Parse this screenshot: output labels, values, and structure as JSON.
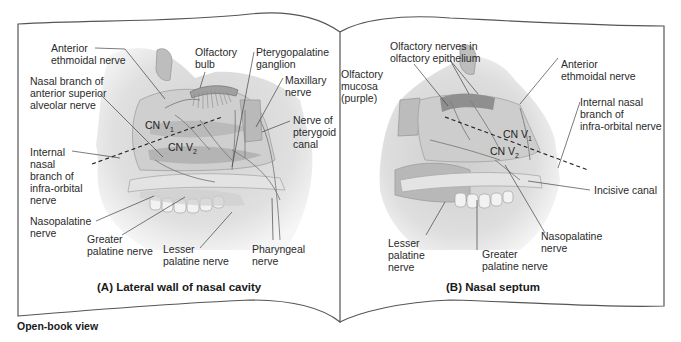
{
  "figure": {
    "footer_label": "Open-book view",
    "panels": [
      {
        "id": "A",
        "caption": "(A) Lateral wall of nasal cavity",
        "labels": {
          "anterior_ethmoidal": [
            "Anterior",
            "ethmoidal nerve"
          ],
          "nasal_branch_asa": [
            "Nasal branch of",
            "anterior superior",
            "alveolar nerve"
          ],
          "olfactory_bulb": [
            "Olfactory",
            "bulb"
          ],
          "pterygopalatine": [
            "Pterygopalatine",
            "ganglion"
          ],
          "maxillary": [
            "Maxillary",
            "nerve"
          ],
          "pterygoid_canal": [
            "Nerve of",
            "pterygoid",
            "canal"
          ],
          "internal_nasal": [
            "Internal",
            "nasal",
            "branch of",
            "infra-orbital",
            "nerve"
          ],
          "nasopalatine": [
            "Nasopalatine",
            "nerve"
          ],
          "greater_palatine": [
            "Greater",
            "palatine nerve"
          ],
          "lesser_palatine": [
            "Lesser",
            "palatine nerve"
          ],
          "pharyngeal": [
            "Pharyngeal",
            "nerve"
          ],
          "cn_v1": {
            "base": "CN V",
            "sub": "1"
          },
          "cn_v2": {
            "base": "CN V",
            "sub": "2"
          }
        }
      },
      {
        "id": "B",
        "caption": "(B) Nasal septum",
        "labels": {
          "olfactory_nerves": [
            "Olfactory nerves in",
            "olfactory epithelium"
          ],
          "olfactory_mucosa": [
            "Olfactory",
            "mucosa",
            "(purple)"
          ],
          "anterior_ethmoidal": [
            "Anterior",
            "ethmoidal nerve"
          ],
          "internal_nasal": [
            "Internal nasal",
            "branch of",
            "infra-orbital nerve"
          ],
          "incisive_canal": [
            "Incisive canal"
          ],
          "nasopalatine": [
            "Nasopalatine",
            "nerve"
          ],
          "lesser_palatine": [
            "Lesser",
            "palatine",
            "nerve"
          ],
          "greater_palatine": [
            "Greater",
            "palatine nerve"
          ],
          "cn_v1": {
            "base": "CN V",
            "sub": "1"
          },
          "cn_v2": {
            "base": "CN V",
            "sub": "2"
          }
        }
      }
    ]
  }
}
